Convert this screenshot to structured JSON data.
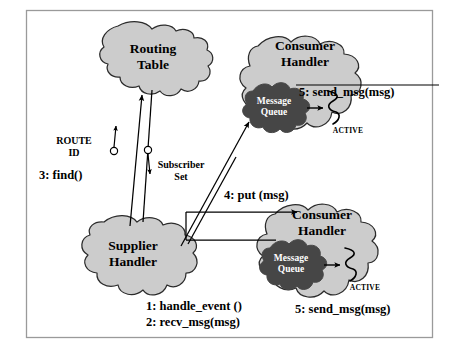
{
  "figure": {
    "border_color": "#9a9a9a",
    "background": "#ffffff"
  },
  "style": {
    "blob_fill": "#cccccc",
    "blob_stroke": "#2b2b2b",
    "queue_fill": "#464646",
    "queue_text": "#ffffff",
    "line_color": "#000000",
    "text_color": "#000000"
  },
  "nodes": {
    "routing_table": {
      "label_line1": "Routing",
      "label_line2": "Table",
      "fill": "#cccccc"
    },
    "supplier_handler": {
      "label_line1": "Supplier",
      "label_line2": "Handler",
      "fill": "#cccccc"
    },
    "consumer_handler_top": {
      "label_line1": "Consumer",
      "label_line2": "Handler",
      "fill": "#cccccc",
      "queue_line1": "Message",
      "queue_line2": "Queue",
      "active_label": "ACTIVE"
    },
    "consumer_handler_bottom": {
      "label_line1": "Consumer",
      "label_line2": "Handler",
      "fill": "#cccccc",
      "queue_line1": "Message",
      "queue_line2": "Queue",
      "active_label": "ACTIVE"
    }
  },
  "ports": {
    "route_id": {
      "label_line1": "ROUTE",
      "label_line2": "ID"
    },
    "subscriber_set": {
      "label_line1": "Subscriber",
      "label_line2": "Set"
    }
  },
  "messages": {
    "step1": "1: handle_event ()",
    "step2": "2: recv_msg(msg)",
    "step3": "3: find()",
    "step4": "4: put (msg)",
    "step5_top": "5: send_msg(msg)",
    "step5_bottom": "5: send_msg(msg)"
  }
}
